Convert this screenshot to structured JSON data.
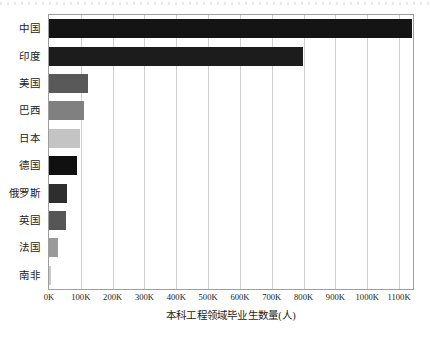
{
  "chart_data": {
    "type": "bar",
    "orientation": "horizontal",
    "title": "",
    "xlabel": "本科工程领域毕业生数量(人)",
    "ylabel": "",
    "categories": [
      "中国",
      "印度",
      "美国",
      "巴西",
      "日本",
      "德国",
      "俄罗斯",
      "英国",
      "法国",
      "南非"
    ],
    "values": [
      1140000,
      797000,
      122000,
      110000,
      97000,
      88000,
      55000,
      53000,
      28000,
      5000
    ],
    "colors": [
      "#141414",
      "#1c1c1c",
      "#595959",
      "#808080",
      "#c4c4c4",
      "#101010",
      "#2e2e2e",
      "#565656",
      "#9a9a9a",
      "#c9c9c9"
    ],
    "xlim": [
      0,
      1143750
    ],
    "xticks": [
      0,
      100000,
      200000,
      300000,
      400000,
      500000,
      600000,
      700000,
      800000,
      900000,
      1000000,
      1100000
    ],
    "xtick_labels": [
      "0K",
      "100K",
      "200K",
      "300K",
      "400K",
      "500K",
      "600K",
      "700K",
      "800K",
      "900K",
      "1000K",
      "1100K"
    ],
    "grid": true,
    "grid_axis": "x",
    "legend": false,
    "legend_position": "none",
    "axis_color": "#9e9e9e",
    "grid_color": "#cfcfcf",
    "background": "#ffffff"
  }
}
